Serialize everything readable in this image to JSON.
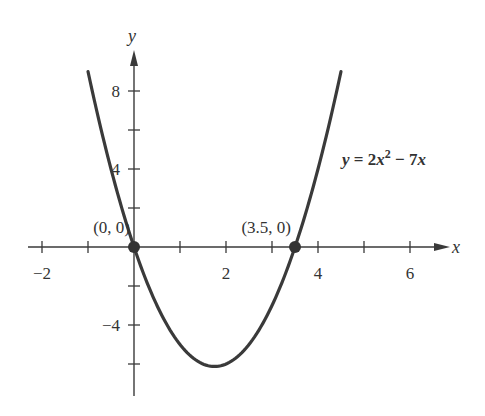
{
  "chart_data": {
    "type": "line",
    "title": "",
    "equation": {
      "lhs": "y",
      "eq": " = ",
      "coef": "2",
      "var": "x",
      "exp": "2",
      "rest": " − 7",
      "var2": "x"
    },
    "xlabel": "x",
    "ylabel": "y",
    "xlim": [
      -2.3,
      6.6
    ],
    "ylim": [
      -6.8,
      10.5
    ],
    "x_ticks": [
      -2,
      -1,
      0,
      1,
      2,
      3,
      4,
      5,
      6
    ],
    "x_tick_labels": [
      {
        "value": -2,
        "label": "−2"
      },
      {
        "value": 2,
        "label": "2"
      },
      {
        "value": 4,
        "label": "4"
      },
      {
        "value": 6,
        "label": "6"
      }
    ],
    "y_ticks": [
      -6,
      -4,
      -2,
      2,
      4,
      6,
      8
    ],
    "y_tick_labels": [
      {
        "value": 8,
        "label": "8"
      },
      {
        "value": 4,
        "label": "4"
      },
      {
        "value": -4,
        "label": "−4"
      }
    ],
    "grid": false,
    "series": [
      {
        "name": "y = 2x^2 - 7x",
        "function": "2*x^2 - 7*x",
        "x_range": [
          -1.0,
          4.5
        ],
        "color": "#3a3a3a"
      }
    ],
    "points": [
      {
        "x": 0,
        "y": 0,
        "label": "(0, 0)"
      },
      {
        "x": 3.5,
        "y": 0,
        "label": "(3.5, 0)"
      }
    ],
    "vertex": {
      "x": 1.75,
      "y": -6.125
    }
  },
  "colors": {
    "axis": "#3a3a3a",
    "curve": "#3a3a3a",
    "point": "#333333"
  }
}
